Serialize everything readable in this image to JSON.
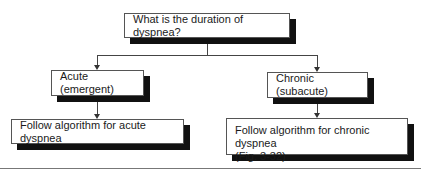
{
  "diagram": {
    "type": "flowchart",
    "root": {
      "label": "What is the duration of dyspnea?"
    },
    "branches": [
      {
        "label": "Acute (emergent)",
        "next": {
          "label": "Follow algorithm for acute dyspnea"
        }
      },
      {
        "label": "Chronic (subacute)",
        "next": {
          "label_line1": "Follow algorithm for chronic dyspnea",
          "label_line2": "(Fig. 3-32)"
        }
      }
    ]
  }
}
